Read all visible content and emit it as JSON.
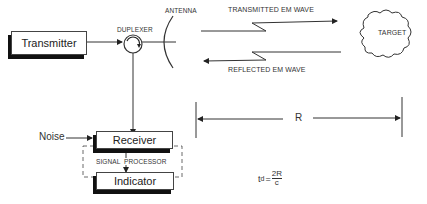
{
  "diagram": {
    "blocks": {
      "transmitter": "Transmitter",
      "receiver": "Receiver",
      "indicator": "Indicator",
      "signal_processor": "SIGNAL  PROCESSOR"
    },
    "labels": {
      "duplexer": "DUPLEXER",
      "antenna": "ANTENNA",
      "transmitted_wave": "TRANSMITTED EM WAVE",
      "reflected_wave": "REFLECTED EM WAVE",
      "target": "TARGET",
      "noise": "Noise",
      "range": "R"
    },
    "formula": {
      "lhs": "t",
      "subscript": "d",
      "equals": "=",
      "numerator": "2R",
      "denominator": "c"
    },
    "colors": {
      "line": "#333333",
      "shadow": "#111111",
      "background": "#ffffff"
    }
  }
}
